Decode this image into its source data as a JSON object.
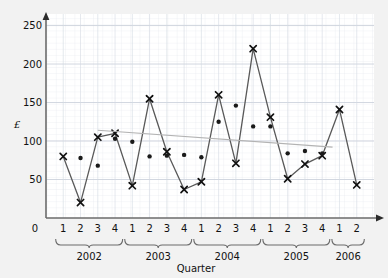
{
  "chart_data": {
    "type": "line",
    "title": "",
    "subtitle": "",
    "xlabel": "Quarter",
    "ylabel": "£",
    "ylim": [
      0,
      265
    ],
    "yticks": [
      0,
      50,
      100,
      150,
      200,
      250
    ],
    "ytick_labels": [
      "0",
      "50",
      "100",
      "150",
      "200",
      "250"
    ],
    "grid": true,
    "grid_minor": true,
    "legend": "none",
    "x": [
      "1",
      "2",
      "3",
      "4",
      "1",
      "2",
      "3",
      "4",
      "1",
      "2",
      "3",
      "4",
      "1",
      "2",
      "3",
      "4",
      "1",
      "2"
    ],
    "xtick_labels": [
      "1",
      "2",
      "3",
      "4",
      "1",
      "2",
      "3",
      "4",
      "1",
      "2",
      "3",
      "4",
      "1",
      "2",
      "3",
      "4",
      "1",
      "2"
    ],
    "x_groups": [
      {
        "label": "2002",
        "start": 0,
        "end": 3
      },
      {
        "label": "2003",
        "start": 4,
        "end": 7
      },
      {
        "label": "2004",
        "start": 8,
        "end": 11
      },
      {
        "label": "2005",
        "start": 12,
        "end": 15
      },
      {
        "label": "2006",
        "start": 16,
        "end": 17
      }
    ],
    "series": [
      {
        "name": "Quarterly value",
        "marker": "x",
        "line": true,
        "color": "#595959",
        "values": [
          80,
          20,
          105,
          110,
          42,
          155,
          86,
          37,
          47,
          160,
          71,
          220,
          131,
          51,
          70,
          81,
          141,
          43
        ]
      },
      {
        "name": "Moving average",
        "marker": "dot",
        "line": false,
        "color": "#1a1a1a",
        "values": [
          null,
          78,
          68,
          103,
          99,
          80,
          81,
          82,
          79,
          125,
          146,
          119,
          119,
          84,
          87,
          84,
          null,
          null
        ]
      },
      {
        "name": "Trend line",
        "marker": "none",
        "line": true,
        "color": "#b3b3b3",
        "trend": {
          "x_start": 2,
          "y_start": 114,
          "x_end": 15.6,
          "y_end": 92
        }
      }
    ]
  },
  "axes": {
    "y_symbol": "£",
    "x_title": "Quarter",
    "origin_label": "0"
  }
}
